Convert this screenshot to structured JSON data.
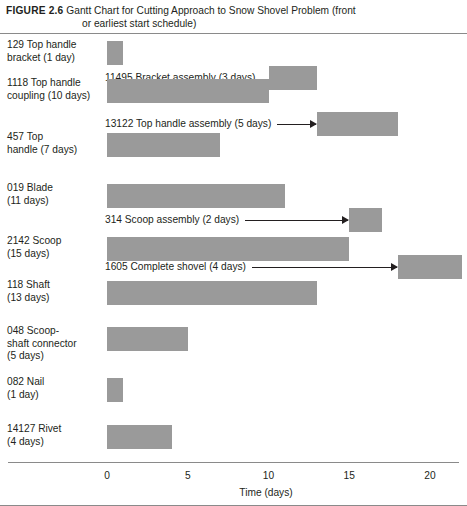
{
  "caption": {
    "figure_number": "FIGURE 2.6",
    "text_line1": "Gantt Chart for Cutting Approach to Snow Shovel Problem (front",
    "text_line2": "or earliest start schedule)"
  },
  "colors": {
    "bar_fill": "#9a9a9a",
    "rule": "#8a8a8a",
    "text": "#231f20"
  },
  "axis": {
    "title": "Time (days)",
    "tick_labels": [
      "0",
      "5",
      "10",
      "15",
      "20"
    ],
    "tick_values": [
      0,
      5,
      10,
      15,
      20
    ],
    "min": 0,
    "max": 22.2
  },
  "chart_data": {
    "type": "bar",
    "title": "Gantt Chart for Cutting Approach to Snow Shovel Problem (front or earliest start schedule)",
    "xlabel": "Time (days)",
    "ylabel": "",
    "xlim": [
      0,
      22.2
    ],
    "grid": false,
    "legend": "none",
    "orientation": "horizontal-gantt",
    "rows": [
      {
        "label": "129 Top handle\nbracket (1 day)",
        "part": "129",
        "name": "Top handle bracket",
        "duration": 1,
        "start": 0,
        "end": 1,
        "label_style": "left-column"
      },
      {
        "label": "11495 Bracket assembly (3 days)",
        "part": "11495",
        "name": "Bracket assembly",
        "duration": 3,
        "start": 10,
        "end": 13,
        "label_style": "inline",
        "has_arrow": false
      },
      {
        "label": "1118 Top handle\ncoupling (10 days)",
        "part": "1118",
        "name": "Top handle coupling",
        "duration": 10,
        "start": 0,
        "end": 10,
        "label_style": "left-column"
      },
      {
        "label": "13122 Top handle assembly (5 days)",
        "part": "13122",
        "name": "Top handle assembly",
        "duration": 5,
        "start": 13,
        "end": 18,
        "label_style": "inline",
        "has_arrow": true
      },
      {
        "label": "457 Top\nhandle (7 days)",
        "part": "457",
        "name": "Top handle",
        "duration": 7,
        "start": 0,
        "end": 7,
        "label_style": "left-column"
      },
      {
        "label": "019 Blade\n(11 days)",
        "part": "019",
        "name": "Blade",
        "duration": 11,
        "start": 0,
        "end": 11,
        "label_style": "left-column"
      },
      {
        "label": "314 Scoop assembly (2 days)",
        "part": "314",
        "name": "Scoop assembly",
        "duration": 2,
        "start": 15,
        "end": 17,
        "label_style": "inline",
        "has_arrow": true
      },
      {
        "label": "2142 Scoop\n(15 days)",
        "part": "2142",
        "name": "Scoop",
        "duration": 15,
        "start": 0,
        "end": 15,
        "label_style": "left-column"
      },
      {
        "label": "1605 Complete shovel (4 days)",
        "part": "1605",
        "name": "Complete shovel",
        "duration": 4,
        "start": 18,
        "end": 22,
        "label_style": "inline",
        "has_arrow": true
      },
      {
        "label": "118 Shaft\n(13 days)",
        "part": "118",
        "name": "Shaft",
        "duration": 13,
        "start": 0,
        "end": 13,
        "label_style": "left-column"
      },
      {
        "label": "048 Scoop-\nshaft connector\n(5 days)",
        "part": "048",
        "name": "Scoop-shaft connector",
        "duration": 5,
        "start": 0,
        "end": 5,
        "label_style": "left-column"
      },
      {
        "label": "082 Nail\n(1 day)",
        "part": "082",
        "name": "Nail",
        "duration": 1,
        "start": 0,
        "end": 1,
        "label_style": "left-column"
      },
      {
        "label": "14127 Rivet\n(4 days)",
        "part": "14127",
        "name": "Rivet",
        "duration": 4,
        "start": 0,
        "end": 4,
        "label_style": "left-column"
      }
    ]
  },
  "layout": {
    "x_origin_px": 107,
    "px_per_day": 16.15,
    "row_tops_px": [
      41,
      66,
      79,
      112,
      133,
      184,
      208,
      237,
      255,
      281,
      327,
      378,
      425
    ],
    "label_tops_px": [
      39,
      64,
      77,
      110,
      131,
      182,
      206,
      235,
      253,
      279,
      325,
      376,
      423
    ],
    "inline_label_x_px": [
      105,
      105,
      105,
      105
    ]
  }
}
